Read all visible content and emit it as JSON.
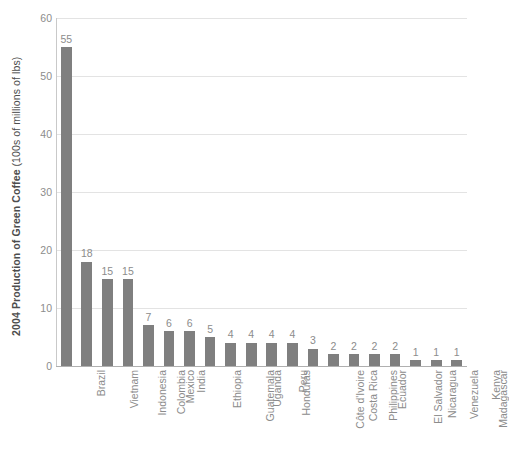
{
  "chart_data": {
    "type": "bar",
    "title": "",
    "subtitle": "",
    "xlabel": "",
    "ylabel": "2004 Production of Green Coffee (100s of millions of lbs)",
    "ylabel_bold_part": "2004 Production of Green Coffee",
    "ylabel_light_part": "(100s of millions of lbs)",
    "ylim": [
      0,
      60
    ],
    "ytick_values": [
      0,
      10,
      20,
      30,
      40,
      50,
      60
    ],
    "ytick_labels": [
      "0",
      "10",
      "20",
      "30",
      "40",
      "50",
      "60"
    ],
    "grid": true,
    "grid_axis": "y",
    "legend": false,
    "legend_position": "none",
    "orientation": "vertical",
    "show_value_labels": true,
    "categories": [
      "Brazil",
      "Vietnam",
      "Indonesia",
      "Colombia",
      "Mexico",
      "India",
      "Ethiopia",
      "Guatemala",
      "Uganda",
      "Honduras",
      "Peru",
      "Côte d'Ivoire",
      "Costa Rica",
      "Philippines",
      "Ecuador",
      "El Salvador",
      "Nicaragua",
      "Venezuela",
      "Madagascar",
      "Kenya"
    ],
    "values": [
      55,
      18,
      15,
      15,
      7,
      6,
      6,
      5,
      4,
      4,
      4,
      4,
      3,
      2,
      2,
      2,
      2,
      1,
      1,
      1
    ],
    "value_labels": [
      "55",
      "18",
      "15",
      "15",
      "7",
      "6",
      "6",
      "5",
      "4",
      "4",
      "4",
      "4",
      "3",
      "2",
      "2",
      "2",
      "2",
      "1",
      "1",
      "1"
    ],
    "colors": {
      "bar": "#7f7f7f",
      "gridline": "#e3e3e3",
      "axis_line": "#c9c9c9",
      "baseline": "#b0b0b0",
      "tick_text": "#8c8c8c",
      "axis_title_text": "#4d4d4d",
      "background": "#ffffff"
    }
  }
}
